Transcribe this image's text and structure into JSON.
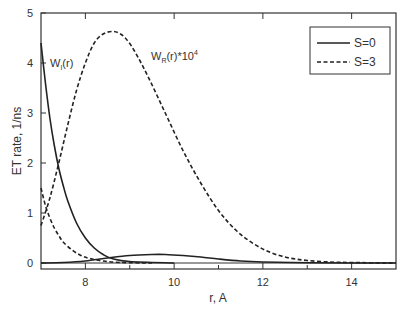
{
  "chart_data": {
    "type": "line",
    "title": "",
    "xlabel": "r, A",
    "ylabel": "ET rate, 1/ns",
    "xlim": [
      7,
      15
    ],
    "ylim": [
      -0.12,
      5
    ],
    "x_ticks": [
      8,
      10,
      12,
      14
    ],
    "x_minor_ticks": [
      9,
      11,
      13
    ],
    "y_ticks": [
      0,
      1,
      2,
      3,
      4,
      5
    ],
    "grid": false,
    "legend_position": "upper right",
    "legend": [
      {
        "label": "S=0",
        "style": "solid"
      },
      {
        "label": "S=3",
        "style": "dashed"
      }
    ],
    "annotations": [
      {
        "text": "W",
        "sub": "I",
        "suffix": "(r)",
        "x": 7.2,
        "y": 4.0
      },
      {
        "text": "W",
        "sub": "R",
        "suffix": "(r)*10",
        "sup": "4",
        "x": 9.2,
        "y": 4.25
      }
    ],
    "series": [
      {
        "name": "S=0 W_I(r)",
        "style": "solid",
        "x": [
          7.0,
          7.1,
          7.2,
          7.3,
          7.4,
          7.5,
          7.6,
          7.8,
          8.0,
          8.2,
          8.4,
          8.6,
          9.0,
          10.0
        ],
        "values": [
          4.4,
          3.6,
          2.9,
          2.35,
          1.9,
          1.55,
          1.25,
          0.8,
          0.5,
          0.3,
          0.17,
          0.09,
          0.03,
          0.0
        ]
      },
      {
        "name": "S=0 W_R(r)*10^4",
        "style": "solid",
        "x": [
          7.0,
          7.5,
          8.0,
          8.5,
          9.0,
          9.5,
          9.8,
          10.2,
          10.6,
          11.0,
          11.5,
          12.0,
          13.0,
          14.0,
          15.0
        ],
        "values": [
          0.0,
          0.01,
          0.04,
          0.1,
          0.15,
          0.17,
          0.17,
          0.15,
          0.12,
          0.08,
          0.04,
          0.02,
          0.005,
          0.0,
          0.0
        ]
      },
      {
        "name": "S=3 W_I(r)",
        "style": "dashed",
        "x": [
          7.0,
          7.1,
          7.2,
          7.3,
          7.4,
          7.5,
          7.7,
          7.9,
          8.1,
          8.4,
          8.8,
          9.5
        ],
        "values": [
          1.5,
          1.15,
          0.9,
          0.7,
          0.55,
          0.42,
          0.26,
          0.15,
          0.09,
          0.04,
          0.01,
          0.0
        ]
      },
      {
        "name": "S=3 W_R(r)*10^4",
        "style": "dashed",
        "x": [
          7.0,
          7.2,
          7.4,
          7.6,
          7.8,
          8.0,
          8.2,
          8.4,
          8.6,
          8.75,
          8.9,
          9.1,
          9.4,
          9.8,
          10.2,
          10.6,
          11.0,
          11.4,
          11.8,
          12.2,
          12.6,
          13.0,
          13.5,
          14.0,
          15.0
        ],
        "values": [
          0.75,
          1.3,
          2.0,
          2.75,
          3.45,
          4.0,
          4.4,
          4.58,
          4.63,
          4.6,
          4.5,
          4.25,
          3.75,
          3.0,
          2.25,
          1.6,
          1.05,
          0.65,
          0.38,
          0.2,
          0.1,
          0.05,
          0.02,
          0.01,
          0.0
        ]
      }
    ]
  }
}
